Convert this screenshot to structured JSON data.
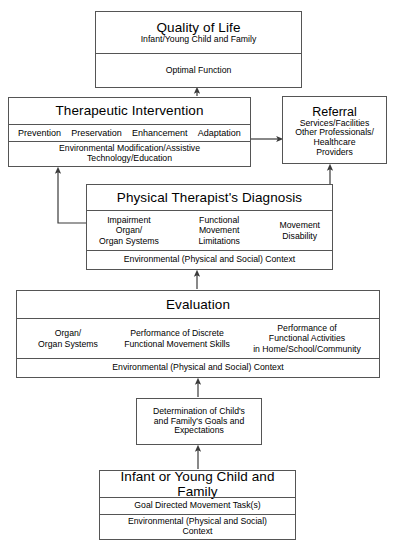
{
  "diagram": {
    "type": "flowchart",
    "orientation": "bottom-up",
    "stroke_color": "#555555",
    "background_color": "#ffffff"
  },
  "quality_of_life": {
    "title": "Quality of Life",
    "subtitle": "Infant/Young Child and Family",
    "outcome": "Optimal Function"
  },
  "therapeutic_intervention": {
    "title": "Therapeutic Intervention",
    "approaches": [
      "Prevention",
      "Preservation",
      "Enhancement",
      "Adaptation"
    ],
    "context_line1": "Environmental Modification/Assistive",
    "context_line2": "Technology/Education"
  },
  "referral": {
    "title": "Referral",
    "lines": [
      "Services/Facilities",
      "Other Professionals/",
      "Healthcare",
      "Providers"
    ]
  },
  "diagnosis": {
    "title": "Physical Therapist's Diagnosis",
    "columns": [
      {
        "lines": [
          "Impairment",
          "Organ/",
          "Organ Systems"
        ]
      },
      {
        "lines": [
          "Functional",
          "Movement",
          "Limitations"
        ]
      },
      {
        "lines": [
          "Movement",
          "Disability"
        ]
      }
    ],
    "context": "Environmental (Physical and Social) Context"
  },
  "evaluation": {
    "title": "Evaluation",
    "columns": [
      {
        "lines": [
          "Organ/",
          "Organ Systems"
        ]
      },
      {
        "lines": [
          "Performance of Discrete",
          "Functional Movement Skills"
        ]
      },
      {
        "lines": [
          "Performance of",
          "Functional Activities",
          "in Home/School/Community"
        ]
      }
    ],
    "context": "Environmental (Physical and Social) Context"
  },
  "determination": {
    "lines": [
      "Determination of Child's",
      "and Family's Goals and",
      "Expectations"
    ]
  },
  "infant": {
    "title": "Infant or Young Child and Family",
    "task": "Goal Directed Movement Task(s)",
    "context_line1": "Environmental (Physical and Social)",
    "context_line2": "Context"
  }
}
